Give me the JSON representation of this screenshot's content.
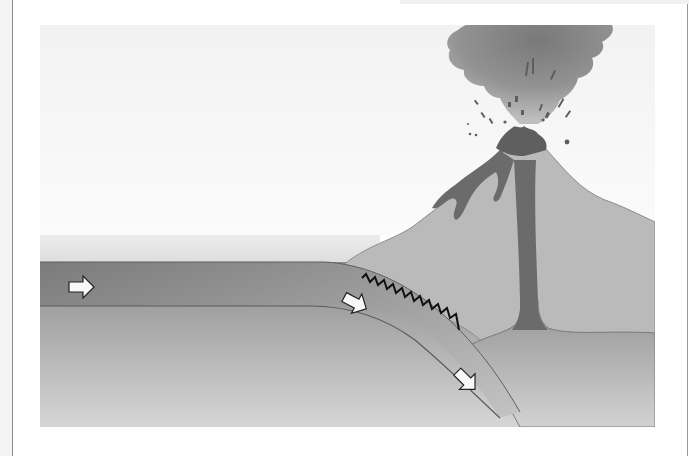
{
  "diagram": {
    "labels": [],
    "elements": {
      "sky": "sky background",
      "ocean": "ocean water layer",
      "oceanic_plate": "subducting oceanic plate",
      "continental_crust": "continental plate with volcano",
      "mantle": "mantle",
      "magma_chamber": "magma chamber",
      "conduit": "magma conduit",
      "lava_flows": "lava flows",
      "ash_cloud": "eruption ash plume",
      "fault_zone": "zigzag fault / earthquake zone"
    },
    "arrows": [
      {
        "id": "plate-motion-horizontal",
        "direction": "right"
      },
      {
        "id": "plate-motion-bend",
        "direction": "down-right"
      },
      {
        "id": "plate-motion-subducting",
        "direction": "down-right"
      }
    ],
    "colors": {
      "background": "#ffffff",
      "sky": "#f3f3f3",
      "ocean": "#e6e6e6",
      "oceanic_plate": "#7d7d7d",
      "volcano": "#b9b9b9",
      "magma": "#6a6a6a",
      "mantle_top": "#8f8f8f",
      "mantle_bottom": "#d3d3d3",
      "ash": "#7a7a7a",
      "arrow_fill": "#f8f8f8",
      "fault_line": "#111111"
    }
  }
}
